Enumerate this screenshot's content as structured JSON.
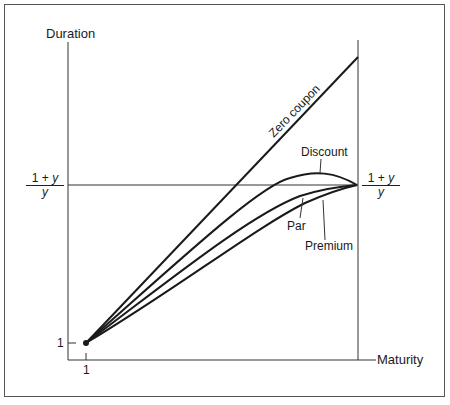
{
  "diagram": {
    "y_axis_label": "Duration",
    "x_axis_label": "Maturity",
    "y_tick_label": "1",
    "x_tick_label": "1",
    "asymptote_left": {
      "numerator_1": "1",
      "plus": "+",
      "numerator_y": "y",
      "denominator": "y"
    },
    "asymptote_right": {
      "numerator_1": "1",
      "plus": "+",
      "numerator_y": "y",
      "denominator": "y"
    },
    "curves": [
      {
        "name": "zero-coupon",
        "label": "Zero  coupon"
      },
      {
        "name": "discount",
        "label": "Discount"
      },
      {
        "name": "par",
        "label": "Par"
      },
      {
        "name": "premium",
        "label": "Premium"
      }
    ],
    "line_color": "#1a1a1a"
  }
}
